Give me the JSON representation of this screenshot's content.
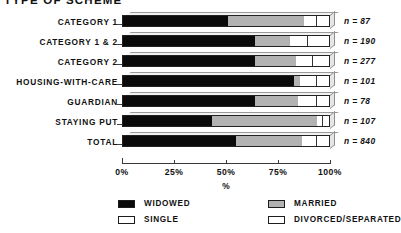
{
  "title": "TYPE OF SCHEME",
  "axis": {
    "x_title": "%",
    "ticks": [
      "0%",
      "25%",
      "50%",
      "75%",
      "100%"
    ]
  },
  "legend": [
    {
      "key": "widowed",
      "label": "WIDOWED",
      "swatch": "black-swatch"
    },
    {
      "key": "married",
      "label": "MARRIED",
      "swatch": "grey-swatch"
    },
    {
      "key": "single",
      "label": "SINGLE",
      "swatch": "white-swatch"
    },
    {
      "key": "divorced",
      "label": "DIVORCED/SEPARATED",
      "swatch": "white-swatch"
    }
  ],
  "rows": [
    {
      "label": "CATEGORY 1",
      "n": "n = 87"
    },
    {
      "label": "CATEGORY 1 & 2",
      "n": "n = 190"
    },
    {
      "label": "CATEGORY 2",
      "n": "n = 277"
    },
    {
      "label": "HOUSING-WITH-CARE",
      "n": "n = 101"
    },
    {
      "label": "GUARDIAN",
      "n": "n = 78"
    },
    {
      "label": "STAYING PUT",
      "n": "n = 107"
    },
    {
      "label": "TOTAL",
      "n": "n = 840"
    }
  ],
  "chart_data": {
    "type": "bar",
    "orientation": "horizontal",
    "stacked": true,
    "title": "TYPE OF SCHEME",
    "xlabel": "%",
    "ylabel": "",
    "xlim": [
      0,
      100
    ],
    "xticks": [
      0,
      25,
      50,
      75,
      100
    ],
    "grid": false,
    "legend_position": "bottom",
    "categories": [
      "CATEGORY 1",
      "CATEGORY 1 & 2",
      "CATEGORY 2",
      "HOUSING-WITH-CARE",
      "GUARDIAN",
      "STAYING PUT",
      "TOTAL"
    ],
    "counts": [
      87,
      190,
      277,
      101,
      78,
      107,
      840
    ],
    "series": [
      {
        "name": "WIDOWED",
        "color": "#0a0a0a",
        "values": [
          51,
          64,
          64,
          83,
          64,
          43,
          55
        ]
      },
      {
        "name": "MARRIED",
        "color": "#b2b2b2",
        "values": [
          37,
          17,
          20,
          3,
          21,
          51,
          32
        ]
      },
      {
        "name": "SINGLE",
        "color": "#ffffff",
        "values": [
          6,
          9,
          8,
          8,
          9,
          3,
          7
        ]
      },
      {
        "name": "DIVORCED/SEPARATED",
        "color": "#ffffff",
        "values": [
          6,
          10,
          8,
          6,
          6,
          3,
          6
        ]
      }
    ]
  }
}
